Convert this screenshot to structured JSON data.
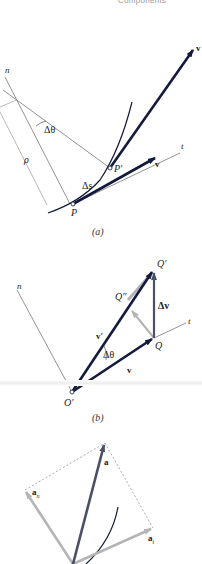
{
  "header": {
    "text": "Components"
  },
  "figure_a": {
    "caption": "(a)",
    "labels": {
      "n": "n",
      "delta_theta": "Δθ",
      "rho": "ρ",
      "delta_s": "Δs",
      "P": "P",
      "P_prime": "P′",
      "t": "t",
      "v": "v",
      "v_prime_top": "v"
    }
  },
  "figure_b": {
    "caption": "(b)",
    "labels": {
      "n": "n",
      "Q_prime": "Q′",
      "Q_double_prime": "Q″",
      "Q": "Q",
      "delta_v": "Δv",
      "v_prime": "v′",
      "v": "v",
      "delta_theta": "Δθ",
      "t": "t",
      "O_prime": "O′"
    }
  },
  "figure_c": {
    "labels": {
      "a": "a",
      "a_n": "a",
      "a_n_sub": "n",
      "a_t": "a",
      "a_t_sub": "t"
    }
  },
  "colors": {
    "vector_dark": "#141a3c",
    "vector_gray": "#b4b4b4",
    "vector_slate": "#4a5068",
    "thin_line": "#777777"
  }
}
